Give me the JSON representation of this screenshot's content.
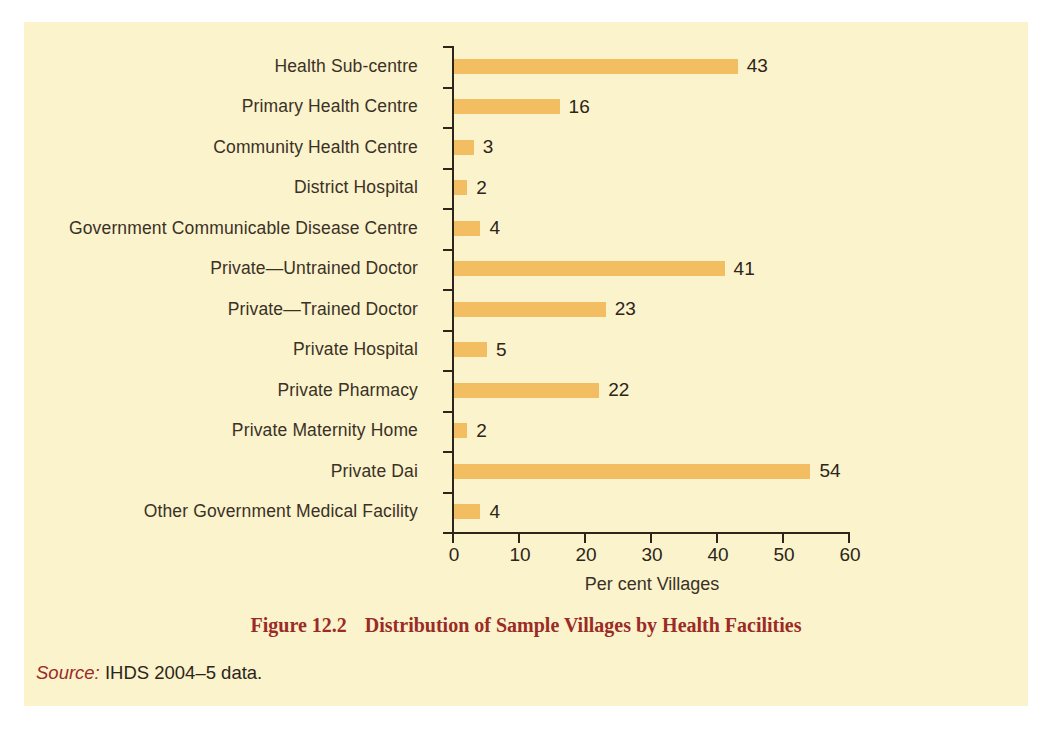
{
  "chart_data": {
    "type": "bar",
    "orientation": "horizontal",
    "title": "Distribution of Sample Villages by Health Facilities",
    "figure_number": "Figure 12.2",
    "xlabel": "Per cent Villages",
    "ylabel": "",
    "xlim": [
      0,
      60
    ],
    "xticks": [
      "0",
      "10",
      "20",
      "30",
      "40",
      "50",
      "60"
    ],
    "xtick_values": [
      0,
      10,
      20,
      30,
      40,
      50,
      60
    ],
    "grid": false,
    "legend": "none",
    "bar_color": "#F3BE62",
    "categories": [
      "Health Sub-centre",
      "Primary Health Centre",
      "Community Health Centre",
      "District Hospital",
      "Government Communicable Disease Centre",
      "Private—Untrained Doctor",
      "Private—Trained Doctor",
      "Private Hospital",
      "Private Pharmacy",
      "Private Maternity Home",
      "Private Dai",
      "Other Government Medical Facility"
    ],
    "values": [
      43,
      16,
      3,
      2,
      4,
      41,
      23,
      5,
      22,
      2,
      54,
      4
    ],
    "value_labels": [
      "43",
      "16",
      "3",
      "2",
      "4",
      "41",
      "23",
      "5",
      "22",
      "2",
      "54",
      "4"
    ]
  },
  "caption": {
    "figure_number": "Figure 12.2",
    "title": "Distribution of Sample Villages by Health Facilities"
  },
  "source": {
    "label": "Source:",
    "text": " IHDS 2004–5 data."
  },
  "colors": {
    "page_background": "#FAF3CC",
    "bar": "#F3BE62",
    "axis": "#2D2519",
    "text": "#2D2519",
    "caption_red": "#9B2B26"
  }
}
